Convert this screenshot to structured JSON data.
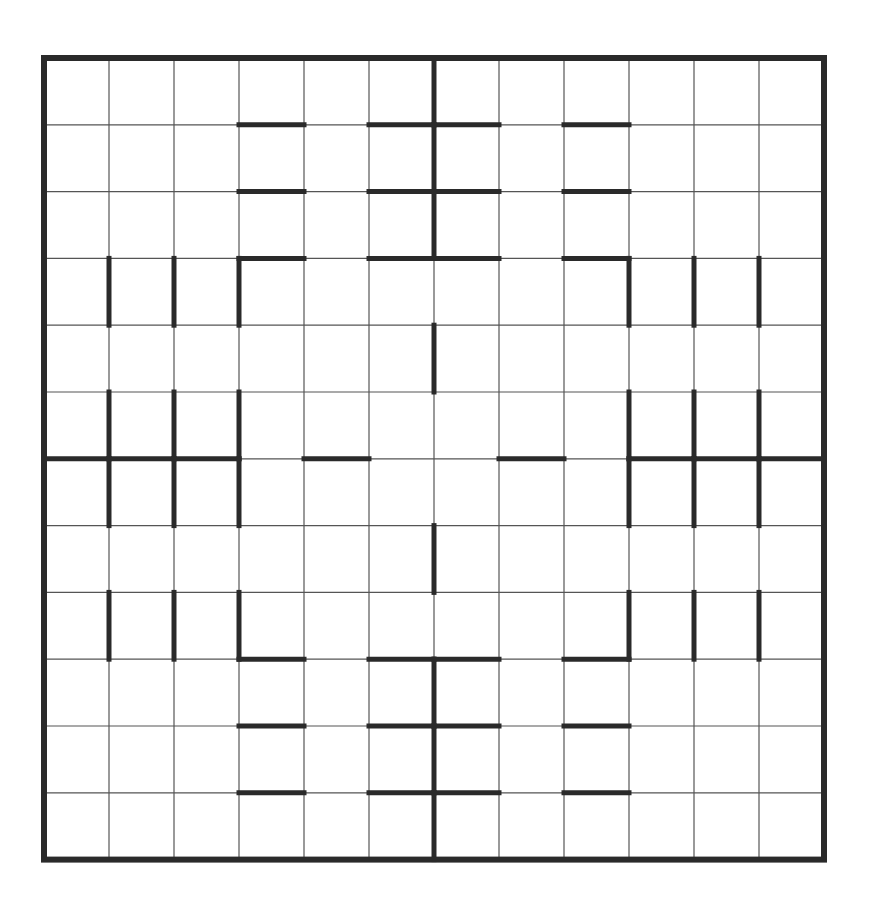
{
  "puzzle": {
    "type": "grid-puzzle",
    "rows": 12,
    "cols": 12,
    "colors": {
      "background": "#ffffff",
      "thin_line": "#555555",
      "thick_line": "#2a2a2a"
    },
    "geometry": {
      "left": 44,
      "top": 58,
      "cell_w": 65,
      "cell_h": 66.8
    },
    "thick_horizontal": [
      {
        "y": 1,
        "cols": [
          3,
          5,
          6,
          8
        ]
      },
      {
        "y": 2,
        "cols": [
          3,
          5,
          6,
          8
        ]
      },
      {
        "y": 3,
        "cols": [
          3,
          5,
          6,
          8
        ]
      },
      {
        "y": 6,
        "cols": [
          0,
          1,
          2,
          4,
          7,
          9,
          10,
          11
        ]
      },
      {
        "y": 9,
        "cols": [
          3,
          5,
          6,
          8
        ]
      },
      {
        "y": 10,
        "cols": [
          3,
          5,
          6,
          8
        ]
      },
      {
        "y": 11,
        "cols": [
          3,
          5,
          6,
          8
        ]
      }
    ],
    "thick_vertical": [
      {
        "x": 1,
        "rows": [
          3,
          5,
          6,
          8
        ]
      },
      {
        "x": 2,
        "rows": [
          3,
          5,
          6,
          8
        ]
      },
      {
        "x": 3,
        "rows": [
          3,
          5,
          6,
          8
        ]
      },
      {
        "x": 6,
        "rows": [
          0,
          1,
          2,
          4,
          7,
          9,
          10,
          11
        ]
      },
      {
        "x": 9,
        "rows": [
          3,
          5,
          6,
          8
        ]
      },
      {
        "x": 10,
        "rows": [
          3,
          5,
          6,
          8
        ]
      },
      {
        "x": 11,
        "rows": [
          3,
          5,
          6,
          8
        ]
      }
    ],
    "cells": []
  }
}
